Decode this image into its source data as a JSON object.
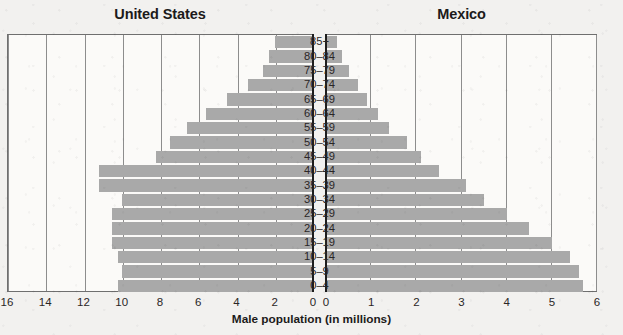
{
  "chart_data": {
    "type": "bar",
    "subtype": "population-pyramid",
    "title": "",
    "xlabel": "Male population (in millions)",
    "ylabel": "",
    "categories": [
      "85+",
      "80–84",
      "75–79",
      "70–74",
      "65–69",
      "60–64",
      "55–59",
      "50–54",
      "45–49",
      "40–44",
      "35–39",
      "30–34",
      "25–29",
      "20–24",
      "15–19",
      "10–14",
      "5–9",
      "0–4"
    ],
    "grid": true,
    "legend_position": "none",
    "bar_color": "#a9a9a9",
    "series": [
      {
        "name": "United States",
        "side": "left",
        "unit": "millions",
        "axis": {
          "min": 0,
          "max": 16,
          "ticks": [
            16,
            14,
            12,
            10,
            8,
            6,
            4,
            2,
            0
          ],
          "direction": "reversed"
        },
        "values": [
          2.0,
          2.3,
          2.6,
          3.4,
          4.5,
          5.6,
          6.6,
          7.5,
          8.2,
          11.2,
          11.2,
          10.0,
          10.5,
          10.5,
          10.5,
          10.2,
          10.0,
          10.2
        ]
      },
      {
        "name": "Mexico",
        "side": "right",
        "unit": "millions",
        "axis": {
          "min": 0,
          "max": 6,
          "ticks": [
            0,
            1,
            2,
            3,
            4,
            5,
            6
          ],
          "direction": "normal"
        },
        "values": [
          0.25,
          0.35,
          0.5,
          0.7,
          0.9,
          1.15,
          1.4,
          1.8,
          2.1,
          2.5,
          3.1,
          3.5,
          4.0,
          4.5,
          5.0,
          5.4,
          5.6,
          5.7
        ]
      }
    ]
  },
  "titles": {
    "united_states": "United States",
    "mexico": "Mexico"
  },
  "axis": {
    "x_title": "Male population (in millions)",
    "left_ticks": [
      "16",
      "14",
      "12",
      "10",
      "8",
      "6",
      "4",
      "2",
      "0"
    ],
    "right_ticks": [
      "0",
      "1",
      "2",
      "3",
      "4",
      "5",
      "6"
    ]
  }
}
